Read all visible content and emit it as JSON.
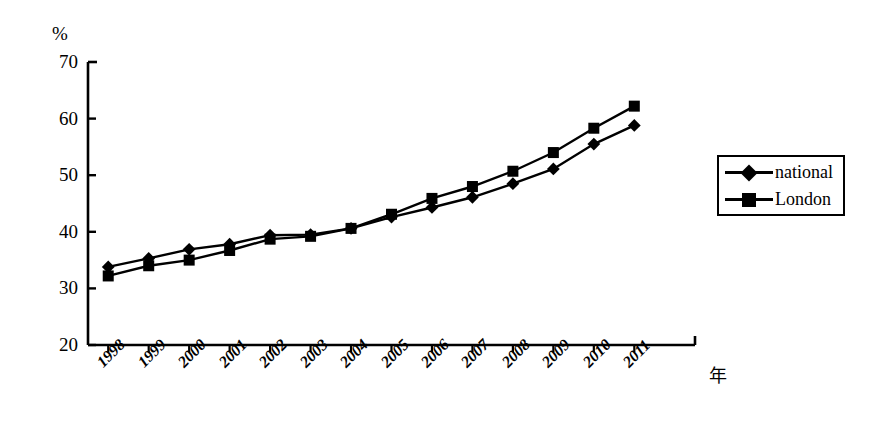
{
  "chart_data": {
    "type": "line",
    "title": "",
    "subtitle": "",
    "xlabel": "年",
    "ylabel": "%",
    "ylim": [
      20,
      70
    ],
    "ytick_labels": [
      "70",
      "60",
      "50",
      "40",
      "30",
      "20"
    ],
    "yticks": [
      70,
      60,
      50,
      40,
      30,
      20
    ],
    "grid": false,
    "legend_position": "right",
    "categories": [
      "1998",
      "1999",
      "2000",
      "2001",
      "2002",
      "2003",
      "2004",
      "2005",
      "2006",
      "2007",
      "2008",
      "2009",
      "2010",
      "2011"
    ],
    "series": [
      {
        "name": "national",
        "marker": "diamond",
        "values": [
          33.8,
          35.3,
          36.9,
          37.8,
          39.4,
          39.5,
          40.6,
          42.6,
          44.3,
          46.1,
          48.5,
          51.1,
          55.5,
          58.8
        ]
      },
      {
        "name": "London",
        "marker": "square",
        "values": [
          32.2,
          34.0,
          35.0,
          36.7,
          38.7,
          39.2,
          40.6,
          43.1,
          45.9,
          48.0,
          50.7,
          54.0,
          58.3,
          62.2
        ]
      }
    ]
  },
  "axes": {
    "unit_label": "%",
    "x_unit_label": "年"
  },
  "legend": {
    "items": [
      {
        "label": "national",
        "marker": "diamond"
      },
      {
        "label": "London",
        "marker": "square"
      }
    ]
  },
  "colors": {
    "line": "#000000",
    "axis": "#000000",
    "background": "#ffffff"
  }
}
